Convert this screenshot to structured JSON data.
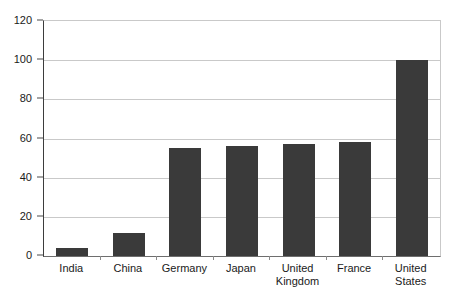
{
  "chart_data": {
    "type": "bar",
    "title": "",
    "subtitle": "",
    "xlabel": "",
    "ylabel": "",
    "categories": [
      "India",
      "China",
      "Germany",
      "Japan",
      "United Kingdom",
      "France",
      "United States"
    ],
    "category_lines": [
      [
        "India"
      ],
      [
        "China"
      ],
      [
        "Germany"
      ],
      [
        "Japan"
      ],
      [
        "United",
        "Kingdom"
      ],
      [
        "France"
      ],
      [
        "United",
        "States"
      ]
    ],
    "values": [
      4,
      12,
      55,
      56,
      57,
      58,
      100
    ],
    "ylim": [
      0,
      120
    ],
    "yticks": [
      0,
      20,
      40,
      60,
      80,
      100,
      120
    ],
    "ytick_labels": [
      "0",
      "20",
      "40",
      "60",
      "80",
      "100",
      "120"
    ],
    "grid": true,
    "grid_axis": "y",
    "legend": false,
    "legend_position": "none",
    "bar_color": "#3a3a3a",
    "gridline_color": "#c9c9c9",
    "axis_color": "#3d3d3d",
    "background_color": "#ffffff",
    "bar_width_px": 32,
    "annotations": []
  }
}
